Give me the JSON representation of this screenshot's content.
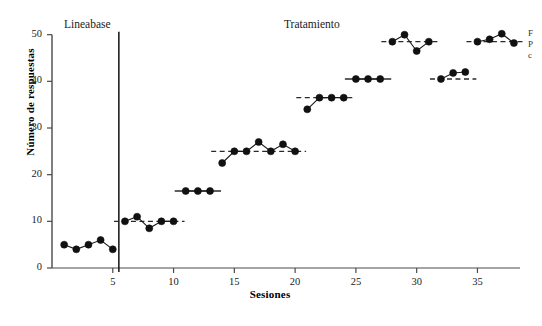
{
  "chart_data": {
    "type": "line",
    "title": "",
    "xlabel": "Sesiones",
    "ylabel": "Número de respuestas",
    "xlim": [
      0,
      38.5
    ],
    "ylim": [
      0,
      51
    ],
    "xticks": [
      5,
      10,
      15,
      20,
      25,
      30,
      35
    ],
    "yticks": [
      0,
      10,
      20,
      30,
      40,
      50
    ],
    "grid": false,
    "legend": null,
    "annotations": [
      {
        "name": "phase-baseline-label",
        "text": "Lineabase",
        "x": 2.8,
        "y": 50
      },
      {
        "name": "phase-treatment-label",
        "text": "Tratamiento",
        "x": 21.5,
        "y": 50
      }
    ],
    "phase_divider_x": 5.5,
    "series": [
      {
        "name": "Lineabase",
        "marker": "filled-circle",
        "line": "solid",
        "x": [
          1,
          2,
          3,
          4,
          5
        ],
        "values": [
          5,
          4,
          5,
          6,
          4
        ]
      },
      {
        "name": "Tratamiento bloque 1",
        "marker": "filled-circle",
        "line": "solid",
        "criterion": 10,
        "criterion_line": "dashed",
        "x": [
          6,
          7,
          8,
          9,
          10
        ],
        "values": [
          10,
          11,
          8.5,
          10,
          10
        ]
      },
      {
        "name": "Tratamiento bloque 2",
        "marker": "filled-circle",
        "line": "solid",
        "criterion": 16.5,
        "criterion_line": "solid",
        "x": [
          11,
          12,
          13
        ],
        "values": [
          16.5,
          16.5,
          16.5
        ]
      },
      {
        "name": "Tratamiento bloque 3",
        "marker": "filled-circle",
        "line": "solid",
        "criterion": 25,
        "criterion_line": "dashed",
        "x": [
          14,
          15,
          16,
          17,
          18,
          19,
          20
        ],
        "values": [
          22.5,
          25,
          25,
          27,
          25,
          26.5,
          25
        ]
      },
      {
        "name": "Tratamiento bloque 4",
        "marker": "filled-circle",
        "line": "solid",
        "criterion": 36.5,
        "criterion_line": "dashed",
        "x": [
          21,
          22,
          23,
          24
        ],
        "values": [
          34,
          36.5,
          36.5,
          36.5
        ]
      },
      {
        "name": "Tratamiento bloque 5",
        "marker": "filled-circle",
        "line": "solid",
        "criterion": 40.5,
        "criterion_line": "solid",
        "x": [
          25,
          26,
          27
        ],
        "values": [
          40.5,
          40.5,
          40.5
        ]
      },
      {
        "name": "Tratamiento bloque 6",
        "marker": "filled-circle",
        "line": "solid",
        "criterion": 48.5,
        "criterion_line": "dashed",
        "x": [
          28,
          29,
          30,
          31
        ],
        "values": [
          48.5,
          50,
          46.5,
          48.5
        ]
      },
      {
        "name": "Tratamiento bloque 7",
        "marker": "filled-circle",
        "line": "solid",
        "criterion": 40.5,
        "criterion_line": "dashed",
        "x": [
          32,
          33,
          34
        ],
        "values": [
          40.5,
          41.8,
          42
        ]
      },
      {
        "name": "Tratamiento bloque 8",
        "marker": "filled-circle",
        "line": "solid",
        "criterion": 48.5,
        "criterion_line": "dashed",
        "x": [
          35,
          36,
          37,
          38
        ],
        "values": [
          48.5,
          49,
          50.2,
          48.2
        ]
      }
    ]
  },
  "edge_caption": {
    "line1": "F",
    "line2": "P",
    "line3": "c"
  }
}
